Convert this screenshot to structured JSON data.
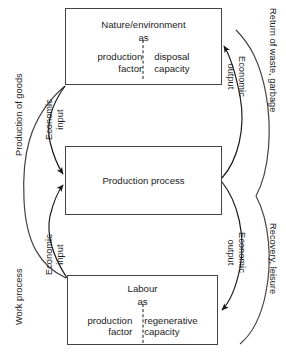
{
  "diagram": {
    "background_color": "#ffffff",
    "line_color": "#444444",
    "text_color": "#1a1a1a"
  },
  "nodes": {
    "nature": {
      "title": "Nature/environment",
      "as": "as",
      "left": "production\nfactor",
      "left_line1": "production",
      "left_line2": "factor",
      "right_line1": "disposal",
      "right_line2": "capacity"
    },
    "process": {
      "title": "Production process"
    },
    "labour": {
      "title": "Labour",
      "as": "as",
      "left_line1": "production",
      "left_line2": "factor",
      "right_line1": "regenerative",
      "right_line2": "capacity"
    }
  },
  "edge_labels": {
    "production_of_goods": "Production of goods",
    "work_process": "Work process",
    "economic_input_top_line1": "Economic",
    "economic_input_top_line2": "input",
    "economic_input_bottom_line1": "Economic",
    "economic_input_bottom_line2": "input",
    "return_of_waste": "Return of waste, garbage",
    "recovery_leisure": "Recovery, leisure",
    "economic_output_top_line1": "Economic",
    "economic_output_top_line2": "output",
    "economic_output_bottom_line1": "Economic",
    "economic_output_bottom_line2": "output"
  }
}
